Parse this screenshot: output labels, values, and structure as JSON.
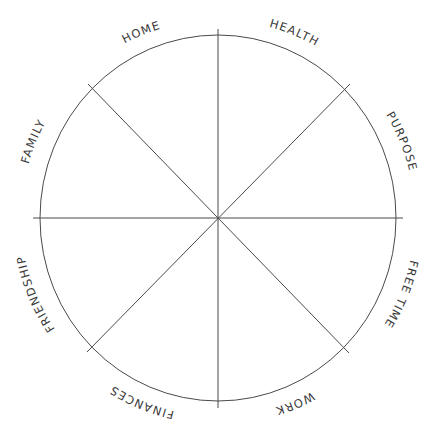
{
  "diagram": {
    "type": "wheel",
    "center": [
      218,
      218
    ],
    "radius_x": 178,
    "radius_y": 182,
    "line_color": "#4a4a4a",
    "text_color": "#3a3a3a",
    "segments": [
      {
        "label": "HOME"
      },
      {
        "label": "HEALTH"
      },
      {
        "label": "PURPOSE"
      },
      {
        "label": "FREE TIME"
      },
      {
        "label": "WORK"
      },
      {
        "label": "FINANCES"
      },
      {
        "label": "FRIENDSHIP"
      },
      {
        "label": "FAMILY"
      }
    ]
  }
}
